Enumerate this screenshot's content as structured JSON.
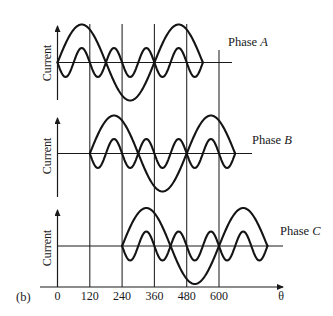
{
  "figure": {
    "panel_label": "(b)",
    "x_axis_symbol": "θ",
    "x_ticks": [
      "0",
      "120",
      "240",
      "360",
      "480",
      "600"
    ],
    "x_tick_values": [
      0,
      120,
      240,
      360,
      480,
      600
    ]
  },
  "panels": [
    {
      "name": "Phase A",
      "name_prefix": "Phase ",
      "name_letter": "A",
      "y_label": "Current",
      "start_deg": 0,
      "end_deg": 540
    },
    {
      "name": "Phase B",
      "name_prefix": "Phase ",
      "name_letter": "B",
      "y_label": "Current",
      "start_deg": 120,
      "end_deg": 660
    },
    {
      "name": "Phase C",
      "name_prefix": "Phase ",
      "name_letter": "C",
      "y_label": "Current",
      "start_deg": 240,
      "end_deg": 780
    }
  ],
  "chart_data": {
    "type": "line",
    "title": "",
    "xlabel": "θ",
    "ylabel": "Current",
    "x_ticks": [
      0,
      120,
      240,
      360,
      480,
      600
    ],
    "grid": "vertical lines at tick positions",
    "series": [
      {
        "name": "Phase A fundamental",
        "formula": "sin(θ)",
        "x_range": [
          0,
          540
        ],
        "relative_amplitude": 1.0
      },
      {
        "name": "Phase A third harmonic",
        "formula": "-sin(3θ)",
        "x_range": [
          0,
          540
        ],
        "relative_amplitude": 0.38
      },
      {
        "name": "Phase B fundamental",
        "formula": "sin(θ-120)",
        "x_range": [
          120,
          660
        ],
        "relative_amplitude": 1.0
      },
      {
        "name": "Phase B third harmonic",
        "formula": "-sin(3(θ-120))",
        "x_range": [
          120,
          660
        ],
        "relative_amplitude": 0.38
      },
      {
        "name": "Phase C fundamental",
        "formula": "sin(θ-240)",
        "x_range": [
          240,
          780
        ],
        "relative_amplitude": 1.0
      },
      {
        "name": "Phase C third harmonic",
        "formula": "-sin(3(θ-240))",
        "x_range": [
          240,
          780
        ],
        "relative_amplitude": 0.38
      }
    ]
  }
}
